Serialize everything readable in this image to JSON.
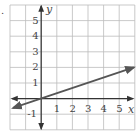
{
  "figure_marker": ".",
  "chart_data": {
    "type": "line",
    "title": "",
    "xlabel": "x",
    "ylabel": "y",
    "xlim": [
      -2,
      6
    ],
    "ylim": [
      -2,
      6
    ],
    "grid": true,
    "x_ticks": [
      "1",
      "2",
      "3",
      "4",
      "5"
    ],
    "y_ticks": [
      "5",
      "4",
      "3",
      "2",
      "1",
      "-1"
    ],
    "series": [
      {
        "name": "line",
        "equation": "y = x/3",
        "points": [
          [
            -1.8,
            -0.6
          ],
          [
            0,
            0
          ],
          [
            3,
            1
          ],
          [
            6,
            2
          ]
        ],
        "arrows": "both",
        "color": "#555555"
      }
    ]
  },
  "colors": {
    "grid": "#bbbbbb",
    "axis": "#333333",
    "line": "#555555"
  }
}
